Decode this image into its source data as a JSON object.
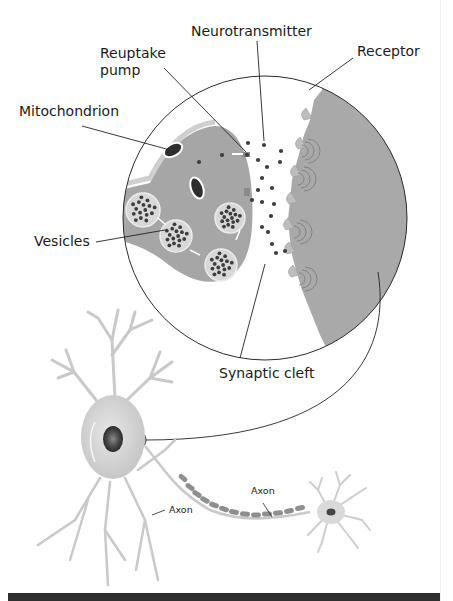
{
  "figure": {
    "labels": {
      "neurotransmitter": "Neurotransmitter",
      "reuptake_pump_line1": "Reuptake",
      "reuptake_pump_line2": "pump",
      "receptor": "Receptor",
      "mitochondrion": "Mitochondrion",
      "vesicles": "Vesicles",
      "synaptic_cleft": "Synaptic cleft",
      "axon_left": "Axon",
      "axon_middle": "Axon"
    },
    "colors": {
      "cell_gray": "#a6a6a6",
      "membrane_light": "#c8c8c8",
      "neuron_body": "#d6d6d6",
      "dot_dark": "#3d3d3d",
      "line": "#222222",
      "bottom_bar": "#2f2f2f"
    }
  }
}
